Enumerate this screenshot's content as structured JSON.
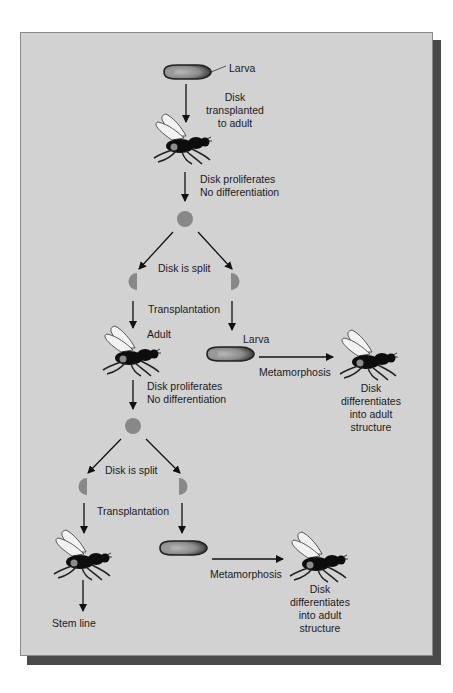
{
  "figure": {
    "colors": {
      "panel": "#d2d2d2",
      "shadow": "#4a4a4a",
      "disk": "#888888",
      "ink": "#1a1a1a"
    },
    "labels": {
      "larva_top": "Larva",
      "transplant_1": "Disk",
      "transplant_2": "transplanted",
      "transplant_3": "to adult",
      "prolif1_1": "Disk proliferates",
      "prolif1_2": "No differentiation",
      "split1": "Disk is split",
      "transplantation1": "Transplantation",
      "adult": "Adult",
      "larva_mid": "Larva",
      "metamorphosis1": "Metamorphosis",
      "diff1_1": "Disk",
      "diff1_2": "differentiates",
      "diff1_3": "into adult",
      "diff1_4": "structure",
      "prolif2_1": "Disk proliferates",
      "prolif2_2": "No differentiation",
      "split2": "Disk is split",
      "transplantation2": "Transplantation",
      "metamorphosis2": "Metamorphosis",
      "diff2_1": "Disk",
      "diff2_2": "differentiates",
      "diff2_3": "into adult",
      "diff2_4": "structure",
      "stem_line": "Stem line"
    },
    "icons": [
      "larva-icon",
      "fly-icon",
      "disk-icon",
      "half-disk-icon",
      "arrow-icon"
    ]
  }
}
